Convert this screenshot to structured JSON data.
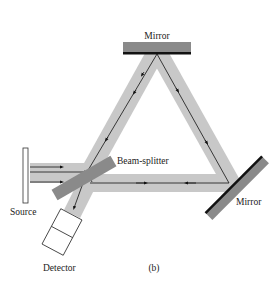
{
  "figure": {
    "panel_label": "(b)",
    "labels": {
      "top_mirror": "Mirror",
      "right_mirror": "Mirror",
      "beam_splitter": "Beam-splitter",
      "source": "Source",
      "detector": "Detector"
    },
    "colors": {
      "beam": "#c8c8c8",
      "mirror_body": "#8a8a8a",
      "mirror_face": "#111111",
      "ray": "#111111"
    }
  }
}
